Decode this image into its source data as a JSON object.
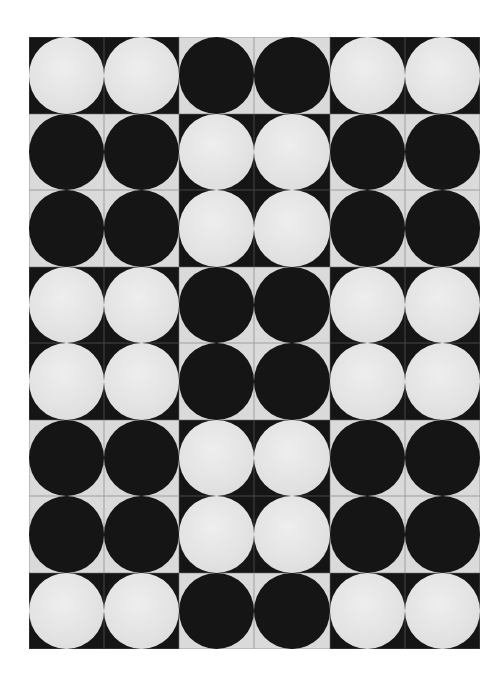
{
  "artwork": {
    "columns": 6,
    "rows": 8,
    "colors": {
      "black": "#151515",
      "white_disc": "#e6e6e6",
      "light_corner": "#dadada",
      "grid_line": "#9a9a9a",
      "background": "#ffffff"
    },
    "grid": [
      [
        "white",
        "white",
        "black",
        "black",
        "white",
        "white"
      ],
      [
        "black",
        "black",
        "white",
        "white",
        "black",
        "black"
      ],
      [
        "black",
        "black",
        "white",
        "white",
        "black",
        "black"
      ],
      [
        "white",
        "white",
        "black",
        "black",
        "white",
        "white"
      ],
      [
        "white",
        "white",
        "black",
        "black",
        "white",
        "white"
      ],
      [
        "black",
        "black",
        "white",
        "white",
        "black",
        "black"
      ],
      [
        "black",
        "black",
        "white",
        "white",
        "black",
        "black"
      ],
      [
        "white",
        "white",
        "black",
        "black",
        "white",
        "white"
      ]
    ]
  }
}
